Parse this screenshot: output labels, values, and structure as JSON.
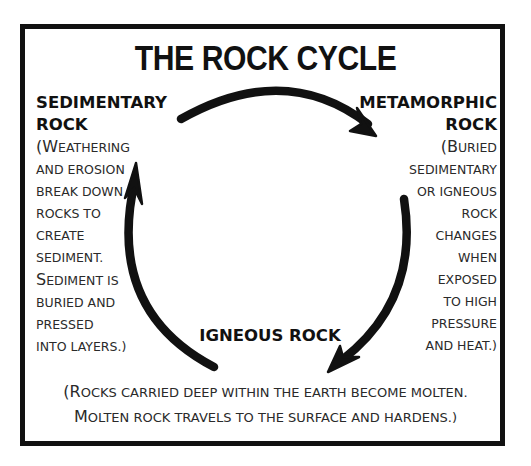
{
  "title": "THE ROCK CYCLE",
  "colors": {
    "ink": "#111111",
    "text": "#2a2a2a",
    "background": "#ffffff"
  },
  "stages": {
    "sedimentary": {
      "heading_lines": [
        "SEDIMENTARY",
        "ROCK"
      ],
      "description_lines": [
        {
          "first": "(W",
          "rest": "EATHERING"
        },
        {
          "first": "",
          "rest": "AND EROSION"
        },
        {
          "first": "",
          "rest": "BREAK DOWN"
        },
        {
          "first": "",
          "rest": "ROCKS TO"
        },
        {
          "first": "",
          "rest": "CREATE"
        },
        {
          "first": "",
          "rest": "SEDIMENT."
        },
        {
          "first": "S",
          "rest": "EDIMENT IS"
        },
        {
          "first": "",
          "rest": "BURIED AND"
        },
        {
          "first": "",
          "rest": "PRESSED"
        },
        {
          "first": "",
          "rest": "INTO LAYERS.)"
        }
      ]
    },
    "metamorphic": {
      "heading_lines": [
        "METAMORPHIC",
        "ROCK"
      ],
      "description_lines": [
        {
          "first": "(B",
          "rest": "URIED"
        },
        {
          "first": "",
          "rest": "SEDIMENTARY"
        },
        {
          "first": "",
          "rest": "OR IGNEOUS"
        },
        {
          "first": "",
          "rest": "ROCK"
        },
        {
          "first": "",
          "rest": "CHANGES"
        },
        {
          "first": "",
          "rest": "WHEN"
        },
        {
          "first": "",
          "rest": "EXPOSED"
        },
        {
          "first": "",
          "rest": "TO HIGH"
        },
        {
          "first": "",
          "rest": "PRESSURE"
        },
        {
          "first": "",
          "rest": "AND HEAT.)"
        }
      ]
    },
    "igneous": {
      "heading": "IGNEOUS ROCK",
      "description_lines": [
        {
          "first": "(R",
          "rest": "OCKS CARRIED DEEP WITHIN THE EARTH BECOME MOLTEN."
        },
        {
          "first": "M",
          "rest": "OLTEN ROCK TRAVELS TO THE SURFACE AND HARDENS.)"
        }
      ]
    }
  },
  "arrows": [
    {
      "from": "sedimentary",
      "to": "metamorphic",
      "icon": "curved-arrow-icon"
    },
    {
      "from": "metamorphic",
      "to": "igneous",
      "icon": "curved-arrow-icon"
    },
    {
      "from": "igneous",
      "to": "sedimentary",
      "icon": "curved-arrow-icon"
    }
  ]
}
